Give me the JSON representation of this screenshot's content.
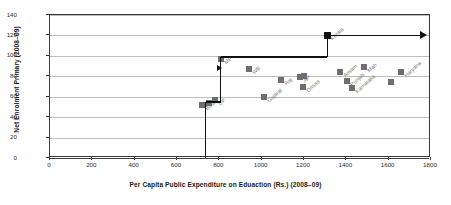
{
  "chart_data": {
    "type": "scatter",
    "title": "",
    "xlabel": "Per Capita Public Expenditure on Eduaction (Rs.) (2008–09)",
    "ylabel": "Net Enrolment Primary (2008–09)",
    "xlim": [
      0,
      1800
    ],
    "ylim": [
      0,
      140
    ],
    "xticks": [
      0,
      200,
      400,
      600,
      800,
      1000,
      1200,
      1400,
      1600,
      1800
    ],
    "yticks": [
      0,
      20,
      40,
      60,
      80,
      100,
      120,
      140
    ],
    "grid": "horizontal",
    "legend": "none",
    "marker_color": "#6e6e6e",
    "highlight_color": "#111111",
    "gridline_color": "#bdbdbd",
    "points": [
      {
        "label": "Bihar",
        "x": 718,
        "y": 52
      },
      {
        "label": "",
        "x": 752,
        "y": 54
      },
      {
        "label": "UP",
        "x": 778,
        "y": 57
      },
      {
        "label": "MP",
        "x": 806,
        "y": 97
      },
      {
        "label": "WB",
        "x": 940,
        "y": 87
      },
      {
        "label": "Gujarat",
        "x": 1012,
        "y": 60
      },
      {
        "label": "Raj",
        "x": 1092,
        "y": 76
      },
      {
        "label": "AP",
        "x": 1182,
        "y": 79
      },
      {
        "label": "",
        "x": 1198,
        "y": 80
      },
      {
        "label": "Orissa",
        "x": 1196,
        "y": 70
      },
      {
        "label": "Assam",
        "x": 1372,
        "y": 84
      },
      {
        "label": "Punjab",
        "x": 1402,
        "y": 75
      },
      {
        "label": "Karnataka",
        "x": 1428,
        "y": 69
      },
      {
        "label": "Mah",
        "x": 1482,
        "y": 89
      },
      {
        "label": "",
        "x": 1612,
        "y": 74
      },
      {
        "label": "Haryana",
        "x": 1660,
        "y": 84
      }
    ],
    "highlight_points": [
      {
        "label": "Kerala",
        "x": 1310,
        "y": 120
      }
    ],
    "annotation_path": {
      "description": "step line",
      "vertices": [
        {
          "x": 735,
          "y": 0
        },
        {
          "x": 735,
          "y": 55
        },
        {
          "x": 806,
          "y": 55
        },
        {
          "x": 806,
          "y": 99
        },
        {
          "x": 1310,
          "y": 99
        },
        {
          "x": 1310,
          "y": 120
        },
        {
          "x": 1750,
          "y": 120
        }
      ],
      "arrow_end": true
    },
    "pointer_marker": {
      "x": 790,
      "y": 88
    }
  },
  "figure": {
    "background": "#ffffff",
    "frame_color": "#3a3a3a"
  }
}
